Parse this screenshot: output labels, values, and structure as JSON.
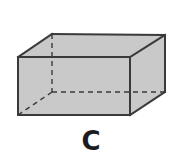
{
  "figure": {
    "label": "C",
    "shape_name": "rectangular-prism",
    "colors": {
      "face_fill": "#c9c9c9",
      "visible_edge": "#3a3a3a",
      "hidden_edge": "#3a3a3a",
      "label_color": "#1c1c1c",
      "background": "#ffffff"
    },
    "vertices": {
      "front_top_left": [
        18,
        57
      ],
      "front_top_right": [
        130,
        57
      ],
      "front_bottom_right": [
        130,
        115
      ],
      "front_bottom_left": [
        18,
        115
      ],
      "back_top_left": [
        52,
        34
      ],
      "back_top_right": [
        165,
        35
      ],
      "back_bottom_right": [
        165,
        92
      ],
      "back_bottom_left": [
        52,
        92
      ]
    },
    "visible_edges": [
      "front_top_left-front_top_right",
      "front_top_right-front_bottom_right",
      "front_bottom_right-front_bottom_left",
      "front_bottom_left-front_top_left",
      "front_top_left-back_top_left",
      "front_top_right-back_top_right",
      "front_bottom_right-back_bottom_right",
      "back_top_left-back_top_right",
      "back_top_right-back_bottom_right"
    ],
    "hidden_edges": [
      "back_top_left-back_bottom_left",
      "back_bottom_left-back_bottom_right",
      "back_bottom_left-front_bottom_left"
    ]
  }
}
